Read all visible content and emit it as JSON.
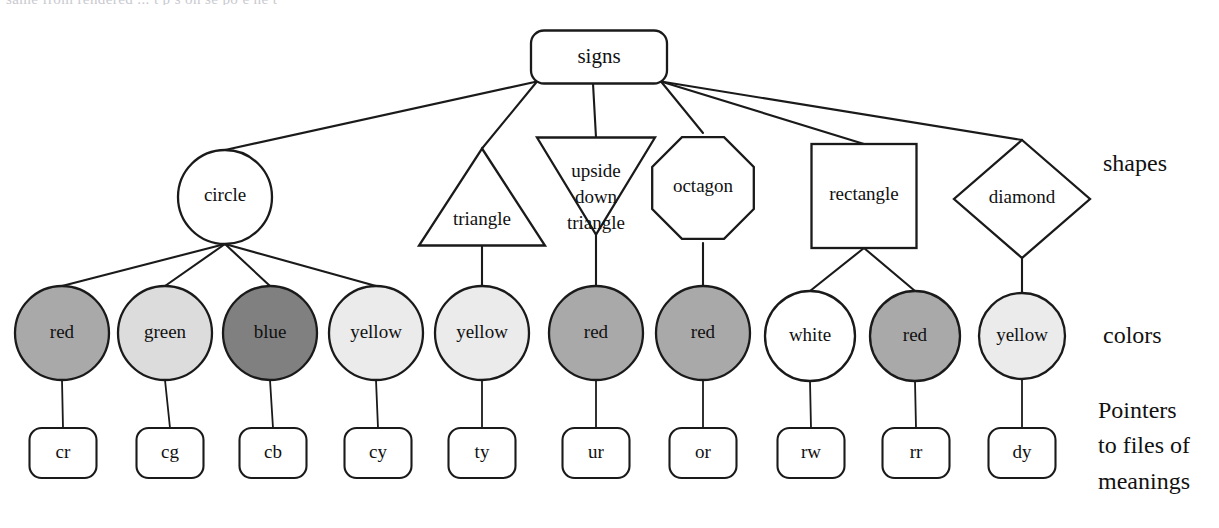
{
  "diagram": {
    "title": "signs",
    "type": "tree",
    "canvas": {
      "width": 1219,
      "height": 528
    },
    "bleed_text": "same from  rendered  ... t  p s  on  se po   e    he  t  ",
    "row_labels": {
      "shapes": "shapes",
      "colors": "colors",
      "pointers_line1": "Pointers",
      "pointers_line2": "to files of",
      "pointers_line3": "meanings"
    },
    "colors": {
      "stroke": "#1a1a1a",
      "white": "#ffffff",
      "red_fill": "#a9a9a9",
      "green_fill": "#dcdcdc",
      "blue_fill": "#808080",
      "yellow_fill": "#ebebeb",
      "white_fill": "#ffffff",
      "text_dark": "#111111",
      "text_light": "#ffffff"
    },
    "root": {
      "label": "signs",
      "shape": "rounded-rect",
      "x": 599,
      "y": 57,
      "w": 136,
      "h": 53,
      "rx": 13
    },
    "shapes": [
      {
        "id": "circle",
        "label": "circle",
        "shape": "circle",
        "cx": 225,
        "cy": 197,
        "r": 47
      },
      {
        "id": "triangle",
        "label": "triangle",
        "shape": "triangle",
        "cx": 482,
        "cy": 197,
        "w": 126,
        "h": 97,
        "label_dy": 24
      },
      {
        "id": "upside",
        "label": "upside down triangle",
        "label_lines": [
          "upside",
          "down",
          "triangle"
        ],
        "shape": "triangle-down",
        "cx": 596,
        "cy": 186,
        "w": 118,
        "h": 97,
        "label_dy": -13
      },
      {
        "id": "octagon",
        "label": "octagon",
        "shape": "octagon",
        "cx": 703,
        "cy": 188,
        "r": 55
      },
      {
        "id": "rectangle",
        "label": "rectangle",
        "shape": "rect",
        "cx": 864,
        "cy": 196,
        "w": 105,
        "h": 104
      },
      {
        "id": "diamond",
        "label": "diamond",
        "shape": "diamond",
        "cx": 1022,
        "cy": 199,
        "w": 136,
        "h": 118
      }
    ],
    "colors_row": [
      {
        "id": "cr",
        "label": "red",
        "fill_key": "red_fill",
        "text_key": "text_dark",
        "cx": 62,
        "cy": 333,
        "r": 47,
        "parent": "circle"
      },
      {
        "id": "cg",
        "label": "green",
        "fill_key": "green_fill",
        "text_key": "text_dark",
        "cx": 165,
        "cy": 333,
        "r": 47,
        "parent": "circle"
      },
      {
        "id": "cb",
        "label": "blue",
        "fill_key": "blue_fill",
        "text_key": "text_light",
        "cx": 270,
        "cy": 333,
        "r": 47,
        "parent": "circle"
      },
      {
        "id": "cy",
        "label": "yellow",
        "fill_key": "yellow_fill",
        "text_key": "text_dark",
        "cx": 376,
        "cy": 333,
        "r": 47,
        "parent": "circle"
      },
      {
        "id": "ty",
        "label": "yellow",
        "fill_key": "yellow_fill",
        "text_key": "text_dark",
        "cx": 482,
        "cy": 333,
        "r": 47,
        "parent": "triangle"
      },
      {
        "id": "ur",
        "label": "red",
        "fill_key": "red_fill",
        "text_key": "text_dark",
        "cx": 596,
        "cy": 333,
        "r": 47,
        "parent": "upside"
      },
      {
        "id": "or",
        "label": "red",
        "fill_key": "red_fill",
        "text_key": "text_dark",
        "cx": 703,
        "cy": 333,
        "r": 47,
        "parent": "octagon"
      },
      {
        "id": "rw",
        "label": "white",
        "fill_key": "white_fill",
        "text_key": "text_dark",
        "cx": 810,
        "cy": 336,
        "r": 45,
        "parent": "rectangle"
      },
      {
        "id": "rr",
        "label": "red",
        "fill_key": "red_fill",
        "text_key": "text_dark",
        "cx": 915,
        "cy": 336,
        "r": 45,
        "parent": "rectangle"
      },
      {
        "id": "dy",
        "label": "yellow",
        "fill_key": "yellow_fill",
        "text_key": "text_dark",
        "cx": 1022,
        "cy": 336,
        "r": 43,
        "parent": "diamond"
      }
    ],
    "leaves": [
      {
        "id": "cr",
        "label": "cr",
        "cx": 63,
        "cy": 453,
        "w": 67,
        "h": 50,
        "rx": 12
      },
      {
        "id": "cg",
        "label": "cg",
        "cx": 170,
        "cy": 453,
        "w": 67,
        "h": 50,
        "rx": 12
      },
      {
        "id": "cb",
        "label": "cb",
        "cx": 273,
        "cy": 453,
        "w": 67,
        "h": 50,
        "rx": 12
      },
      {
        "id": "cy",
        "label": "cy",
        "cx": 378,
        "cy": 453,
        "w": 67,
        "h": 50,
        "rx": 12
      },
      {
        "id": "ty",
        "label": "ty",
        "cx": 482,
        "cy": 453,
        "w": 67,
        "h": 50,
        "rx": 12
      },
      {
        "id": "ur",
        "label": "ur",
        "cx": 596,
        "cy": 453,
        "w": 67,
        "h": 50,
        "rx": 12
      },
      {
        "id": "or",
        "label": "or",
        "cx": 703,
        "cy": 453,
        "w": 67,
        "h": 50,
        "rx": 12
      },
      {
        "id": "rw",
        "label": "rw",
        "cx": 811,
        "cy": 453,
        "w": 67,
        "h": 50,
        "rx": 12
      },
      {
        "id": "rr",
        "label": "rr",
        "cx": 916,
        "cy": 453,
        "w": 67,
        "h": 50,
        "rx": 12
      },
      {
        "id": "dy",
        "label": "dy",
        "cx": 1022,
        "cy": 453,
        "w": 67,
        "h": 50,
        "rx": 12
      }
    ],
    "side_label_positions": {
      "shapes_x": 1103,
      "shapes_y": 165,
      "colors_x": 1103,
      "colors_y": 337,
      "pointers_x": 1098,
      "pointers_y1": 412,
      "pointers_y2": 447,
      "pointers_y3": 483
    }
  }
}
